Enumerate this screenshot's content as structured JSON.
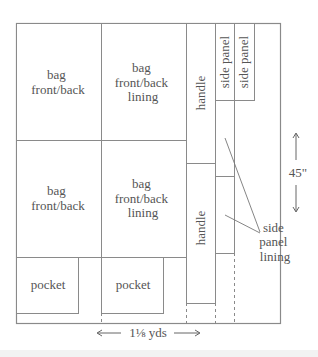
{
  "pieces": {
    "bag_front_back_1": [
      "bag",
      "front/back"
    ],
    "bag_front_back_lining_1": [
      "bag",
      "front/back",
      "lining"
    ],
    "bag_front_back_2": [
      "bag",
      "front/back"
    ],
    "bag_front_back_lining_2": [
      "bag",
      "front/back",
      "lining"
    ],
    "pocket_1": "pocket",
    "pocket_2": "pocket",
    "handle_1": "handle",
    "handle_2": "handle",
    "side_panel_1": "side panel",
    "side_panel_2": "side panel",
    "side_panel_lining": [
      "side",
      "panel",
      "lining"
    ]
  },
  "dimensions": {
    "width_label": "1⅛ yds",
    "height_label": "45\""
  },
  "colors": {
    "line": "#8a8a8a",
    "text": "#555555",
    "background": "#ffffff"
  }
}
